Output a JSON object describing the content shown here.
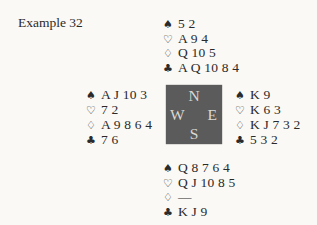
{
  "title": "Example 32",
  "suit_symbols": {
    "spade": "♠",
    "heart": "♡",
    "diamond": "♢",
    "club": "♣"
  },
  "compass": {
    "north": "N",
    "east": "E",
    "south": "S",
    "west": "W"
  },
  "hands": {
    "north": {
      "spades": "5 2",
      "hearts": "A 9 4",
      "diamonds": "Q 10 5",
      "clubs": "A Q 10 8 4"
    },
    "west": {
      "spades": "A J 10 3",
      "hearts": "7 2",
      "diamonds": "A 9 8 6 4",
      "clubs": "7 6"
    },
    "east": {
      "spades": "K 9",
      "hearts": "K 6 3",
      "diamonds": "K J 7 3 2",
      "clubs": "5 3 2"
    },
    "south": {
      "spades": "Q 8 7 6 4",
      "hearts": "Q J 10 8 5",
      "diamonds": "—",
      "clubs": "K J 9"
    }
  },
  "colors": {
    "page_background": "#faf9f6",
    "text": "#2a2a2a",
    "compass_background": "#5b5b5b",
    "compass_letters": "#d8d8d4"
  }
}
